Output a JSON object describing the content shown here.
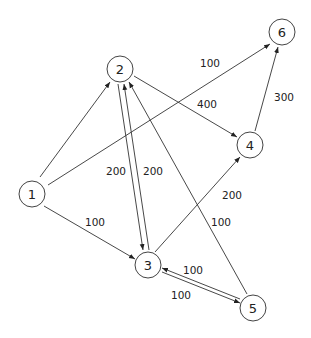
{
  "diagram": {
    "type": "directed-weighted-graph",
    "nodes": [
      {
        "id": "1",
        "label": "1",
        "x": 32,
        "y": 194
      },
      {
        "id": "2",
        "label": "2",
        "x": 120,
        "y": 69
      },
      {
        "id": "3",
        "label": "3",
        "x": 148,
        "y": 265
      },
      {
        "id": "4",
        "label": "4",
        "x": 250,
        "y": 145
      },
      {
        "id": "5",
        "label": "5",
        "x": 253,
        "y": 308
      },
      {
        "id": "6",
        "label": "6",
        "x": 282,
        "y": 32
      }
    ],
    "edges": [
      {
        "from": "1",
        "to": "2",
        "weight": ""
      },
      {
        "from": "1",
        "to": "6",
        "weight": "100"
      },
      {
        "from": "1",
        "to": "3",
        "weight": "100"
      },
      {
        "from": "2",
        "to": "4",
        "weight": "400"
      },
      {
        "from": "2",
        "to": "3",
        "weight": "200"
      },
      {
        "from": "3",
        "to": "2",
        "weight": "200"
      },
      {
        "from": "3",
        "to": "4",
        "weight": "200"
      },
      {
        "from": "5",
        "to": "2",
        "weight": "100"
      },
      {
        "from": "3",
        "to": "5",
        "weight": "100"
      },
      {
        "from": "5",
        "to": "3",
        "weight": "100"
      },
      {
        "from": "4",
        "to": "6",
        "weight": "300"
      }
    ],
    "edge_labels": {
      "e_1_6": "100",
      "e_2_4": "400",
      "e_4_6": "300",
      "e_2_3": "200",
      "e_3_2": "200",
      "e_3_4": "200",
      "e_5_2": "100",
      "e_1_3": "100",
      "e_3_5": "100",
      "e_5_3": "100"
    },
    "node_labels": {
      "n1": "1",
      "n2": "2",
      "n3": "3",
      "n4": "4",
      "n5": "5",
      "n6": "6"
    }
  }
}
